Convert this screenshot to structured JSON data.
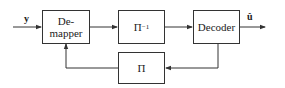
{
  "diagram": {
    "input_label": "y",
    "output_label": "û",
    "blocks": [
      {
        "id": "demapper",
        "label_line1": "De-",
        "label_line2": "mapper"
      },
      {
        "id": "deinterleaver",
        "label": "Π",
        "superscript": "−1"
      },
      {
        "id": "decoder",
        "label": "Decoder"
      },
      {
        "id": "interleaver",
        "label": "Π"
      }
    ],
    "edges": [
      {
        "from": "input",
        "to": "demapper",
        "label": "y"
      },
      {
        "from": "demapper",
        "to": "deinterleaver"
      },
      {
        "from": "deinterleaver",
        "to": "decoder"
      },
      {
        "from": "decoder",
        "to": "output",
        "label": "û"
      },
      {
        "from": "decoder",
        "to": "interleaver"
      },
      {
        "from": "interleaver",
        "to": "demapper"
      }
    ]
  }
}
